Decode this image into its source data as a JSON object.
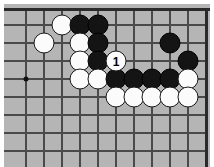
{
  "diagram": {
    "kind": "go-board-diagram",
    "board_color": "#b5b5b5",
    "line_color": "#4a4a4a",
    "edge_color": "#2a2a2a",
    "black_stone_color": "#141414",
    "white_stone_color": "#fbfbfb",
    "grid_spacing": 17.8,
    "stone_diameter": 21,
    "board_edges": [
      "top",
      "right"
    ],
    "vertical_lines_x": [
      22,
      40,
      58,
      76,
      94,
      112,
      130,
      148,
      166,
      184
    ],
    "horizontal_lines_y": [
      21,
      39,
      57,
      75,
      93,
      111,
      129,
      147,
      165
    ],
    "star_points": [
      {
        "name": "hoshi-upper-left",
        "x": 22,
        "y": 75
      }
    ],
    "stones": [
      {
        "name": "white-stone-1",
        "color": "white",
        "x": 58,
        "y": 21,
        "label": ""
      },
      {
        "name": "black-stone-1",
        "color": "black",
        "x": 76,
        "y": 21,
        "label": ""
      },
      {
        "name": "black-stone-2",
        "color": "black",
        "x": 94,
        "y": 21,
        "label": ""
      },
      {
        "name": "white-stone-2",
        "color": "white",
        "x": 40,
        "y": 39,
        "label": ""
      },
      {
        "name": "white-stone-3",
        "color": "white",
        "x": 76,
        "y": 39,
        "label": ""
      },
      {
        "name": "black-stone-3",
        "color": "black",
        "x": 94,
        "y": 39,
        "label": ""
      },
      {
        "name": "black-stone-4",
        "color": "black",
        "x": 166,
        "y": 39,
        "label": ""
      },
      {
        "name": "white-stone-4",
        "color": "white",
        "x": 76,
        "y": 57,
        "label": ""
      },
      {
        "name": "black-stone-5",
        "color": "black",
        "x": 94,
        "y": 57,
        "label": ""
      },
      {
        "name": "move-1-stone",
        "color": "white",
        "x": 112,
        "y": 57,
        "label": "1"
      },
      {
        "name": "black-stone-6",
        "color": "black",
        "x": 184,
        "y": 57,
        "label": ""
      },
      {
        "name": "white-stone-5",
        "color": "white",
        "x": 76,
        "y": 75,
        "label": ""
      },
      {
        "name": "white-stone-6",
        "color": "white",
        "x": 94,
        "y": 75,
        "label": ""
      },
      {
        "name": "black-stone-7",
        "color": "black",
        "x": 112,
        "y": 75,
        "label": ""
      },
      {
        "name": "black-stone-8",
        "color": "black",
        "x": 130,
        "y": 75,
        "label": ""
      },
      {
        "name": "black-stone-9",
        "color": "black",
        "x": 148,
        "y": 75,
        "label": ""
      },
      {
        "name": "black-stone-10",
        "color": "black",
        "x": 166,
        "y": 75,
        "label": ""
      },
      {
        "name": "white-stone-7",
        "color": "white",
        "x": 184,
        "y": 75,
        "label": ""
      },
      {
        "name": "white-stone-8",
        "color": "white",
        "x": 112,
        "y": 93,
        "label": ""
      },
      {
        "name": "white-stone-9",
        "color": "white",
        "x": 130,
        "y": 93,
        "label": ""
      },
      {
        "name": "white-stone-10",
        "color": "white",
        "x": 148,
        "y": 93,
        "label": ""
      },
      {
        "name": "white-stone-11",
        "color": "white",
        "x": 166,
        "y": 93,
        "label": ""
      },
      {
        "name": "white-stone-12",
        "color": "white",
        "x": 184,
        "y": 93,
        "label": ""
      }
    ]
  }
}
